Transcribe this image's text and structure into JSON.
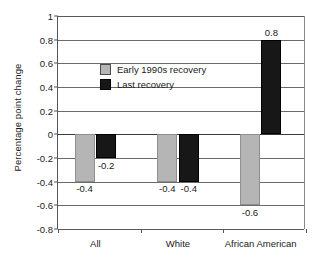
{
  "chart_data": {
    "type": "bar",
    "title": "",
    "xlabel": "",
    "ylabel": "Percentage point change",
    "categories": [
      "All",
      "White",
      "African American"
    ],
    "series": [
      {
        "name": "Early 1990s recovery",
        "color": "#b5b5b5",
        "values": [
          -0.4,
          -0.4,
          -0.6
        ],
        "labels": [
          "-0.4",
          "-0.4",
          "-0.6"
        ]
      },
      {
        "name": "Last recovery",
        "color": "#171717",
        "values": [
          -0.2,
          -0.4,
          0.8
        ],
        "labels": [
          "-0.2",
          "-0.4",
          "0.8"
        ]
      }
    ],
    "ylim": [
      -0.8,
      1
    ],
    "yticks": [
      1,
      0.8,
      0.6,
      0.4,
      0.2,
      0,
      -0.2,
      -0.4,
      -0.6,
      -0.8
    ],
    "ytick_labels": [
      "1",
      "0.8",
      "0.6",
      "0.4",
      "0.2",
      "0",
      "-0.2",
      "-0.4",
      "-0.6",
      "-0.8"
    ],
    "grid": true,
    "legend_position": "upper-left-inside"
  },
  "legend": {
    "entries": [
      {
        "label": "Early 1990s recovery"
      },
      {
        "label": "Last recovery"
      }
    ]
  }
}
